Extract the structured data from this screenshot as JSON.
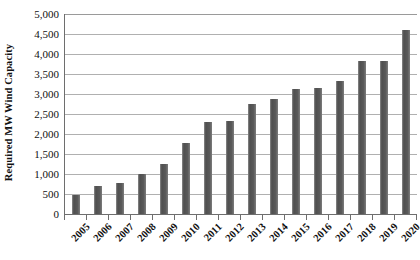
{
  "chart_data": {
    "type": "bar",
    "title": "",
    "xlabel": "",
    "ylabel": "Required MW Wind Capacity",
    "ylim": [
      0,
      5000
    ],
    "ytick_step": 500,
    "ytick_labels": [
      "5,000",
      "4,500",
      "4,000",
      "3,500",
      "3,000",
      "2,500",
      "2,000",
      "1,500",
      "1,000",
      "500",
      "0"
    ],
    "ytick_values": [
      5000,
      4500,
      4000,
      3500,
      3000,
      2500,
      2000,
      1500,
      1000,
      500,
      0
    ],
    "grid": "horizontal",
    "legend": "none",
    "categories": [
      "2005",
      "2006",
      "2007",
      "2008",
      "2009",
      "2010",
      "2011",
      "2012",
      "2013",
      "2014",
      "2015",
      "2016",
      "2017",
      "2018",
      "2019",
      "2020"
    ],
    "values": [
      480,
      700,
      780,
      1010,
      1240,
      1770,
      2300,
      2330,
      2750,
      2880,
      3120,
      3160,
      3330,
      3820,
      3820,
      4600
    ],
    "series": [
      {
        "name": "Required MW Wind Capacity",
        "color": "#595959",
        "values": [
          480,
          700,
          780,
          1010,
          1240,
          1770,
          2300,
          2330,
          2750,
          2880,
          3120,
          3160,
          3330,
          3820,
          3820,
          4600
        ]
      }
    ]
  },
  "colors": {
    "bar": "#595959",
    "gridline": "#b0b0b0",
    "axis": "#6e6e6e",
    "text": "#111111",
    "background": "#ffffff"
  }
}
